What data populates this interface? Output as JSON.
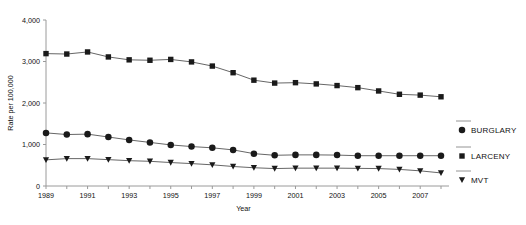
{
  "chart_data": {
    "type": "line",
    "title": "",
    "xlabel": "Year",
    "ylabel": "Rate per 100,000",
    "xlim": [
      1989,
      2008
    ],
    "ylim": [
      0,
      4000
    ],
    "yticks": [
      0,
      1000,
      2000,
      3000,
      4000
    ],
    "ytick_labels": [
      "0",
      "1,000",
      "2,000",
      "3,000",
      "4,000"
    ],
    "xticks": [
      1989,
      1991,
      1993,
      1995,
      1997,
      1999,
      2001,
      2003,
      2005,
      2007
    ],
    "xtick_labels": [
      "1989",
      "1991",
      "1993",
      "1995",
      "1997",
      "1999",
      "2001",
      "2003",
      "2005",
      "2007"
    ],
    "x": [
      1989,
      1990,
      1991,
      1992,
      1993,
      1994,
      1995,
      1996,
      1997,
      1998,
      1999,
      2000,
      2001,
      2002,
      2003,
      2004,
      2005,
      2006,
      2007,
      2008
    ],
    "grid": false,
    "legend_position": "right",
    "series": [
      {
        "name": "LARCENY",
        "marker": "square",
        "color": "#1a1a1a",
        "values": [
          3190,
          3180,
          3230,
          3110,
          3040,
          3030,
          3050,
          2990,
          2890,
          2730,
          2550,
          2480,
          2490,
          2460,
          2420,
          2370,
          2290,
          2210,
          2190,
          2150
        ]
      },
      {
        "name": "BURGLARY",
        "marker": "circle",
        "color": "#1a1a1a",
        "values": [
          1280,
          1240,
          1250,
          1180,
          1110,
          1050,
          990,
          950,
          920,
          870,
          780,
          740,
          750,
          750,
          745,
          730,
          730,
          730,
          730,
          730
        ]
      },
      {
        "name": "MVT",
        "marker": "triangle-down",
        "color": "#1a1a1a",
        "values": [
          630,
          660,
          660,
          635,
          610,
          595,
          565,
          540,
          510,
          470,
          440,
          420,
          430,
          430,
          430,
          425,
          420,
          400,
          365,
          315
        ]
      }
    ]
  },
  "legend": {
    "items": [
      {
        "label": "BURGLARY",
        "marker": "circle"
      },
      {
        "label": "LARCENY",
        "marker": "square"
      },
      {
        "label": "MVT",
        "marker": "triangle-down"
      }
    ]
  }
}
